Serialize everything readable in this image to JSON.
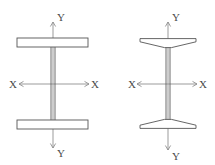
{
  "figure": {
    "background_color": "#ffffff",
    "outline_color": "#555555",
    "axis_color": "#8a8a8a",
    "label_color": "#4a4a4a",
    "width_px": 215,
    "height_px": 165
  },
  "sections": [
    {
      "id": "left-section",
      "name": "wide-flange-section",
      "shape_type": "W-shape wide flange I-beam with parallel rectangular flanges",
      "flange_profile": "rectangular",
      "geometry": {
        "flange_left_x": 17,
        "flange_right_x": 88,
        "top_flange_top_y": 38,
        "top_flange_bottom_y": 47,
        "bottom_flange_top_y": 120,
        "bottom_flange_bottom_y": 129,
        "web_left_x": 51,
        "web_right_x": 55,
        "centroid_x": 53,
        "centroid_y": 84
      },
      "axes": {
        "vertical": {
          "name": "Y-Y",
          "x": 53,
          "top_y": 22,
          "bottom_y": 148,
          "label_top": "Y",
          "label_bottom": "Y",
          "label_top_pos": {
            "x": 57,
            "y": 21
          },
          "label_bottom_pos": {
            "x": 57,
            "y": 157
          },
          "arrow_top": true,
          "arrow_bottom": true
        },
        "horizontal": {
          "name": "X-X",
          "y": 84,
          "left_x": 19,
          "right_x": 89,
          "label_left": "X",
          "label_right": "X",
          "label_left_pos": {
            "x": 9,
            "y": 88
          },
          "label_right_pos": {
            "x": 91,
            "y": 88
          },
          "arrow_left": true,
          "arrow_right": true
        }
      }
    },
    {
      "id": "right-section",
      "name": "american-standard-section",
      "shape_type": "S-shape American Standard I-beam with tapered sloping flanges",
      "flange_profile": "tapered",
      "geometry": {
        "flange_left_x": 140,
        "flange_right_x": 196,
        "top_flange_top_y": 38,
        "top_flange_root_bottom_y": 48,
        "top_flange_tip_bottom_y": 42,
        "bottom_flange_bottom_y": 129,
        "bottom_flange_root_top_y": 119,
        "bottom_flange_tip_top_y": 125,
        "web_left_x": 166,
        "web_right_x": 170,
        "centroid_x": 168,
        "centroid_y": 84
      },
      "axes": {
        "vertical": {
          "name": "Y-Y",
          "x": 168,
          "top_y": 22,
          "bottom_y": 150,
          "label_top": "Y",
          "label_bottom": "Y",
          "label_top_pos": {
            "x": 172,
            "y": 21
          },
          "label_bottom_pos": {
            "x": 172,
            "y": 160
          },
          "arrow_top": true,
          "arrow_bottom": true
        },
        "horizontal": {
          "name": "X-X",
          "y": 84,
          "left_x": 137,
          "right_x": 197,
          "label_left": "X",
          "label_right": "X",
          "label_left_pos": {
            "x": 128,
            "y": 88
          },
          "label_right_pos": {
            "x": 199,
            "y": 88
          },
          "arrow_left": true,
          "arrow_right": true
        }
      }
    }
  ],
  "labels": {
    "y_axis": "Y",
    "x_axis": "X"
  }
}
